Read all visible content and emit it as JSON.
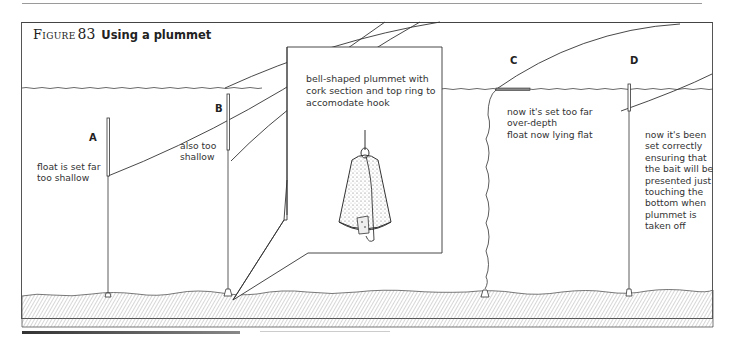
{
  "figure": {
    "label": "Figure",
    "number": "83",
    "title": "Using a plummet"
  },
  "floats": [
    {
      "id": "A",
      "label": "A",
      "note": "float is set far\ntoo shallow"
    },
    {
      "id": "B",
      "label": "B",
      "note": "also too\nshallow"
    },
    {
      "id": "C",
      "label": "C",
      "note": "now it's set too far\nover-depth\nfloat now lying flat"
    },
    {
      "id": "D",
      "label": "D",
      "note": "now it's been\nset correctly\nensuring that\nthe bait will be\npresented just\ntouching the\nbottom when\nplummet is\ntaken off"
    }
  ],
  "callout": {
    "text": "bell-shaped plummet with\ncork section and top ring to\naccomodate hook",
    "icon": "bell-plummet-icon"
  },
  "colors": {
    "line": "#333333",
    "frame": "#555555",
    "text": "#222222"
  }
}
